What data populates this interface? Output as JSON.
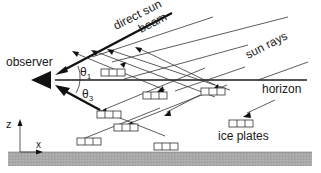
{
  "diagram": {
    "labels": {
      "observer": "observer",
      "direct_sun_beam_1": "direct sun",
      "direct_sun_beam_2": "beam",
      "sun_rays": "sun rays",
      "horizon": "horizon",
      "ice_plates": "ice plates",
      "theta1": "θ",
      "theta1_sub": "1",
      "theta3": "θ",
      "theta3_sub": "3",
      "axis_z": "z",
      "axis_x": "x"
    },
    "colors": {
      "ground": "#a9a9a9",
      "lines": "#333333",
      "background": "#ffffff"
    }
  }
}
